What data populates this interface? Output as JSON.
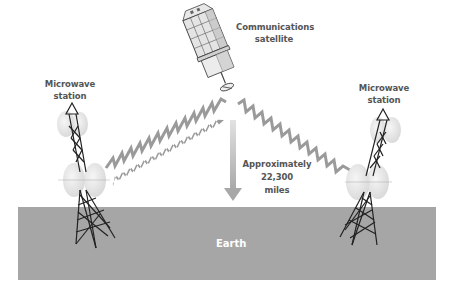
{
  "diagram": {
    "type": "satellite-microwave-relay",
    "labels": {
      "satellite": [
        "Communications",
        "satellite"
      ],
      "left_station": [
        "Microwave",
        "station"
      ],
      "right_station": [
        "Microwave",
        "station"
      ],
      "distance": [
        "Approximately",
        "22,300",
        "miles"
      ],
      "ground": "Earth"
    },
    "colors": {
      "background": "#ffffff",
      "earth": "#a6a6a6",
      "earth_label": "#ffffff",
      "text": "#555555",
      "signal": "#9a9a9a",
      "arrow": "#b8b8b8",
      "tower": "#222222",
      "dish": "#dcdcdc"
    },
    "nodes": [
      {
        "id": "satellite",
        "label": "Communications satellite"
      },
      {
        "id": "left_station",
        "label": "Microwave station"
      },
      {
        "id": "right_station",
        "label": "Microwave station"
      },
      {
        "id": "earth",
        "label": "Earth"
      }
    ],
    "edges": [
      {
        "from": "left_station",
        "to": "satellite",
        "style": "zigzag-signal"
      },
      {
        "from": "satellite",
        "to": "right_station",
        "style": "zigzag-signal"
      },
      {
        "from": "satellite",
        "to": "earth",
        "style": "arrow",
        "label": "Approximately 22,300 miles"
      }
    ]
  }
}
